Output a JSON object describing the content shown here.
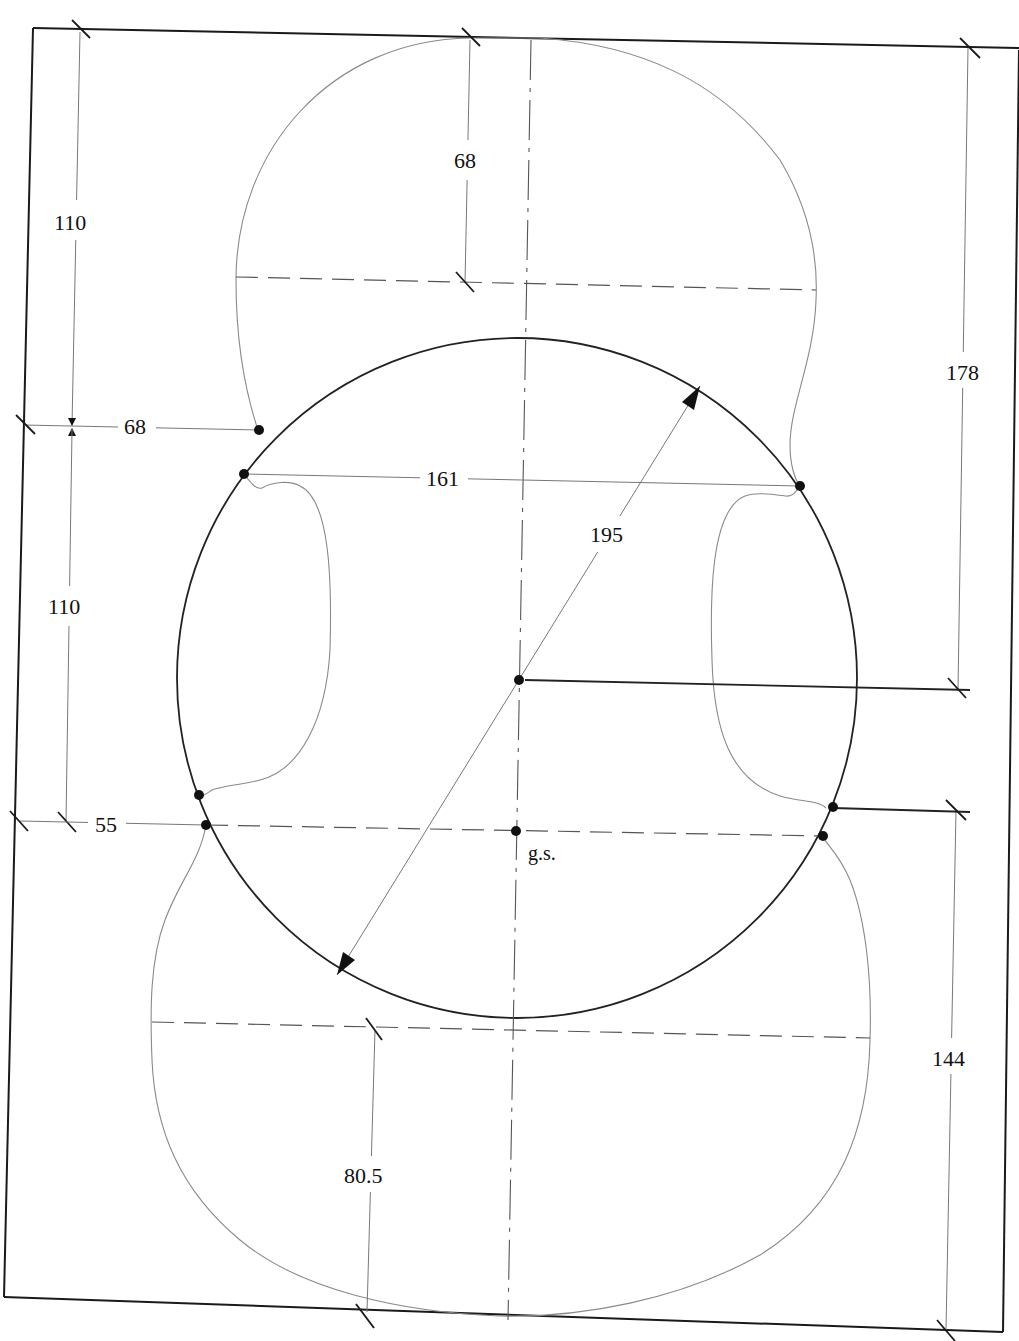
{
  "drawing": {
    "subject": "Violin body outline with construction circle",
    "dimensions": {
      "top_block_height": "110",
      "upper_bout_half": "68",
      "c_bout_offset": "68",
      "upper_corner_width": "161",
      "middle_height": "110",
      "circle_diameter": "195",
      "lower_offset": "55",
      "upper_total": "178",
      "lower_total": "144",
      "lower_bout_half": "80.5"
    },
    "markers": {
      "geometric_center_label": "g.s."
    },
    "colors": {
      "frame": "#1a1a1a",
      "outline": "#8a8a8a",
      "circle": "#222222",
      "construction": "#555555"
    }
  }
}
